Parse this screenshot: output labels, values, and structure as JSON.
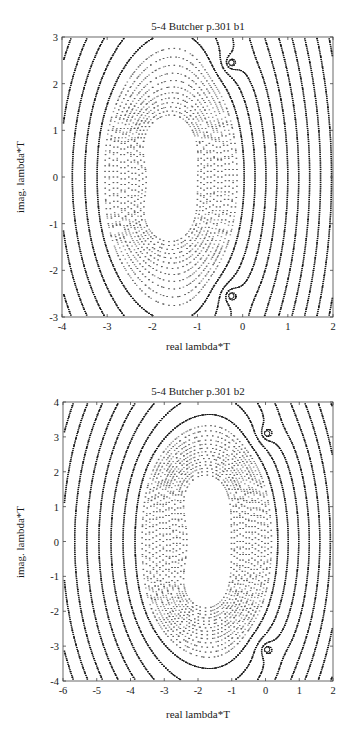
{
  "chart_data": [
    {
      "type": "contour",
      "title": "5-4 Butcher p.301 b1",
      "xlabel": "real lambda*T",
      "ylabel": "imag. lambda*T",
      "xlim": [
        -4,
        2
      ],
      "ylim": [
        -3,
        3
      ],
      "xticks": [
        -4,
        -3,
        -2,
        -1,
        0,
        1,
        2
      ],
      "yticks": [
        -3,
        -2,
        -1,
        0,
        1,
        2,
        3
      ],
      "xtick_labels": [
        "-4",
        "-3",
        "-2",
        "-1",
        "0",
        "1",
        "2"
      ],
      "ytick_labels": [
        "-3",
        "-2",
        "-1",
        "0",
        "1",
        "2",
        "3"
      ],
      "grid": false,
      "line_style": "dotted contours, solid near poles",
      "features": {
        "poles": [
          {
            "x": -0.25,
            "y": 2.45
          },
          {
            "x": -0.25,
            "y": -2.55
          }
        ],
        "inner_lobes": [
          {
            "x": -1.75,
            "y": 0.8,
            "radius": 0.35
          },
          {
            "x": -1.75,
            "y": -0.9,
            "radius": 0.35
          }
        ],
        "outer_extent": {
          "x_min": -3.1,
          "x_max": 0.15,
          "y_min": -2.95,
          "y_max": 2.9
        }
      },
      "contour_levels": 12
    },
    {
      "type": "contour",
      "title": "5-4 Butcher p.301 b2",
      "xlabel": "real lambda*T",
      "ylabel": "imag. lambda*T",
      "xlim": [
        -6,
        2
      ],
      "ylim": [
        -4,
        4
      ],
      "xticks": [
        -6,
        -5,
        -4,
        -3,
        -2,
        -1,
        0,
        1,
        2
      ],
      "yticks": [
        -4,
        -3,
        -2,
        -1,
        0,
        1,
        2,
        3,
        4
      ],
      "xtick_labels": [
        "-6",
        "-5",
        "-4",
        "-3",
        "-2",
        "-1",
        "0",
        "1",
        "2"
      ],
      "ytick_labels": [
        "-4",
        "-3",
        "-2",
        "-1",
        "0",
        "1",
        "2",
        "3",
        "4"
      ],
      "grid": false,
      "line_style": "dotted contours, solid near poles",
      "features": {
        "poles": [
          {
            "x": 0.05,
            "y": 3.1
          },
          {
            "x": 0.05,
            "y": -3.1
          }
        ],
        "inner_lobes": [
          {
            "x": -1.9,
            "y": 1.5,
            "radius": 0.5
          },
          {
            "x": -1.9,
            "y": -1.5,
            "radius": 0.5
          }
        ],
        "outer_extent": {
          "x_min": -3.7,
          "x_max": 0.5,
          "y_min": -3.4,
          "y_max": 3.4
        }
      },
      "contour_levels": 14
    }
  ]
}
